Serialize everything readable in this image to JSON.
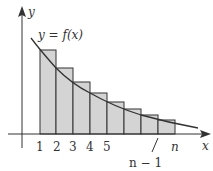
{
  "diagram": {
    "curve_label": "y = f(x)",
    "axis_labels": {
      "x": "x",
      "y": "y"
    },
    "tick_labels": [
      "1",
      "2",
      "3",
      "4",
      "5",
      "n − 1",
      "n"
    ],
    "colors": {
      "bar_fill": "#d4d4d4",
      "stroke": "#333333",
      "background": "#ffffff"
    }
  }
}
